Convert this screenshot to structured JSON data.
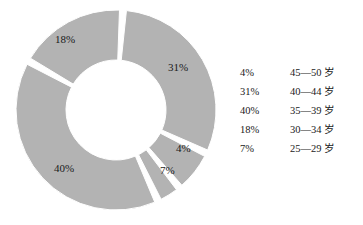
{
  "chart_data": {
    "type": "pie",
    "title": "",
    "subtitle": "",
    "xlabel": "",
    "ylabel": "",
    "donut": true,
    "hole_ratio": 0.5,
    "slice_gap_degrees": 4,
    "start_angle_degrees": 4,
    "direction": "clockwise",
    "grid": false,
    "legend_position": "right",
    "colors": {
      "slice_fill": "#b3b3b3",
      "slice_edge": "#ffffff",
      "label_text": "#1a1a1a",
      "background": "#ffffff"
    },
    "categories": [
      "40—44 岁",
      "25—29 岁",
      "45—50 岁",
      "35—39 岁",
      "30—34 岁"
    ],
    "values": [
      31,
      7,
      4,
      40,
      18
    ],
    "slices": [
      {
        "label": "31%",
        "value": 31,
        "category": "40—44 岁",
        "label_x": 168,
        "label_y": 61
      },
      {
        "label": "7%",
        "value": 7,
        "category": "25—29 岁",
        "label_x": 160,
        "label_y": 164
      },
      {
        "label": "4%",
        "value": 4,
        "category": "45—50 岁",
        "label_x": 176,
        "label_y": 142
      },
      {
        "label": "40%",
        "value": 40,
        "category": "35—39 岁",
        "label_x": 54,
        "label_y": 162
      },
      {
        "label": "18%",
        "value": 18,
        "category": "30—34 岁",
        "label_x": 55,
        "label_y": 33
      }
    ]
  },
  "legend": {
    "rows": [
      {
        "percent": "4%",
        "range": "45—50 岁"
      },
      {
        "percent": "31%",
        "range": "40—44 岁"
      },
      {
        "percent": "40%",
        "range": "35—39 岁"
      },
      {
        "percent": "18%",
        "range": "30—34 岁"
      },
      {
        "percent": "7%",
        "range": "25—29 岁"
      }
    ]
  }
}
